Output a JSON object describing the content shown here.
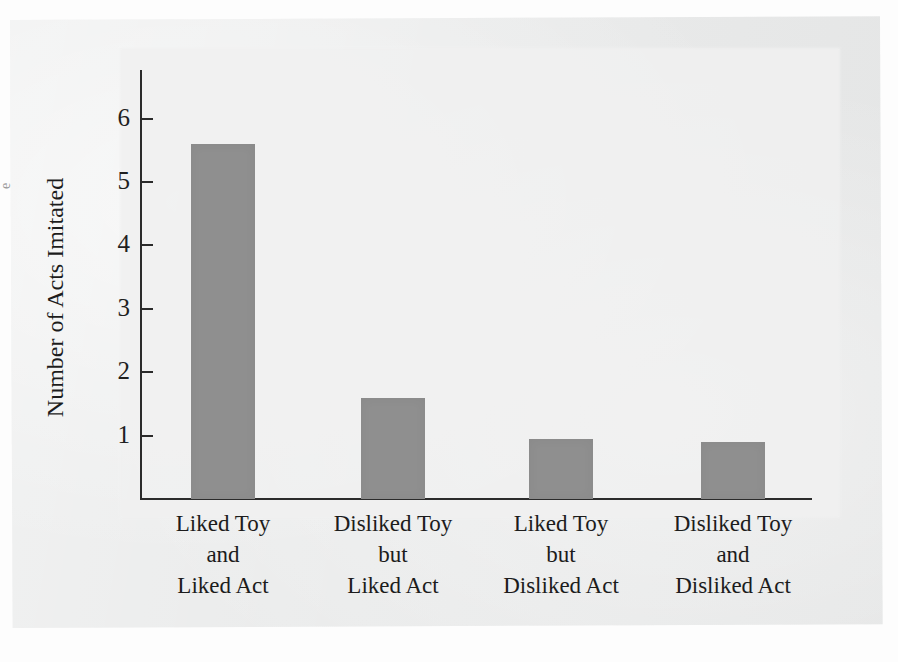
{
  "chart_data": {
    "type": "bar",
    "title": "",
    "subtitle": "",
    "xlabel": "",
    "ylabel": "Number of Acts Imitated",
    "categories": [
      "Liked Toy\nand\nLiked Act",
      "Disliked Toy\nbut\nLiked Act",
      "Liked Toy\nbut\nDisliked Act",
      "Disliked Toy\nand\nDisliked Act"
    ],
    "values": [
      5.6,
      1.6,
      0.95,
      0.9
    ],
    "ylim": [
      0,
      6.4
    ],
    "y_ticks": [
      1,
      2,
      3,
      4,
      5,
      6
    ],
    "y_tick_labels": [
      "1",
      "2",
      "3",
      "4",
      "5",
      "6"
    ],
    "grid": false,
    "legend": null,
    "bar_color": "#8f8f8f",
    "axis_color": "#2b2b2b",
    "background_color": "#e9eaea",
    "annotations": []
  },
  "figure": {
    "edge_fragment_text": "e"
  }
}
